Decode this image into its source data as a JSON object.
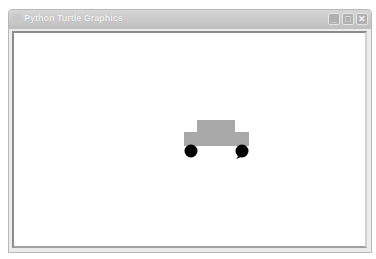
{
  "window": {
    "title": "Python Turtle Graphics",
    "controls": {
      "minimize": "_",
      "maximize": "□",
      "close": "✕"
    }
  },
  "canvas": {
    "background": "#ffffff",
    "drawing": {
      "description": "car drawn by turtle",
      "body_color": "#a8a8a8",
      "wheel_color": "#000000",
      "turtle_color": "#000000"
    }
  }
}
